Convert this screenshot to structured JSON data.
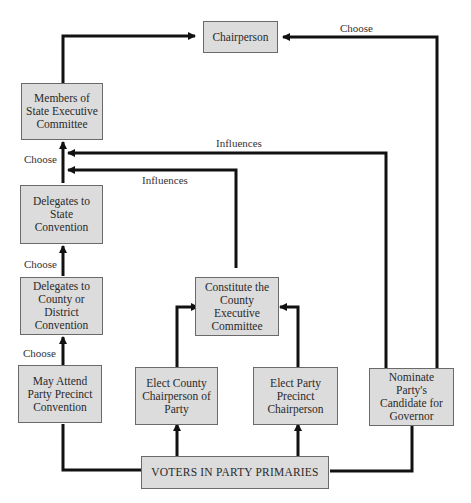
{
  "diagram": {
    "nodes": {
      "chairperson": "Chairperson",
      "state_exec": "Members of State Executive Committee",
      "state_conv": "Delegates to State Convention",
      "county_conv": "Delegates to County or District Convention",
      "precinct_conv": "May Attend Party Precinct Convention",
      "county_exec": "Constitute the County Executive Committee",
      "county_chair": "Elect County Chairperson of Party",
      "precinct_chair": "Elect Party Precinct Chairperson",
      "governor": "Nominate Party's Candidate for Governor",
      "voters": "VOTERS IN PARTY PRIMARIES"
    },
    "edge_labels": {
      "choose_chair": "Choose",
      "influences_top": "Influences",
      "influences_lower": "Influences",
      "choose_state_exec": "Choose",
      "choose_state_conv": "Choose",
      "choose_county_conv": "Choose"
    }
  }
}
